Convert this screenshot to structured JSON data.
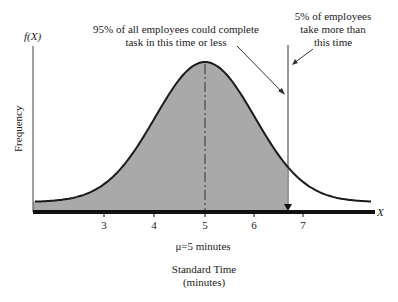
{
  "chart_data": {
    "type": "area",
    "title": "",
    "xlabel": "Standard Time (minutes)",
    "ylabel": "Frequency",
    "y_axis_symbol": "f(X)",
    "x_axis_symbol": "X",
    "x_ticks": [
      3,
      4,
      5,
      6,
      7
    ],
    "mean": 5,
    "mean_label": "μ=5 minutes",
    "cutoff": 6.65,
    "shaded_region": "below cutoff",
    "annotations": [
      {
        "text": "95% of all employees could complete task in this time or less",
        "lines": [
          "95% of all employees could complete",
          "task in this time or less"
        ],
        "points_to": "left side of cutoff line"
      },
      {
        "text": "5% of employees take more than this time",
        "lines": [
          "5% of employees",
          "take more than",
          "this time"
        ],
        "points_to": "right side of cutoff line"
      }
    ],
    "grid": false,
    "legend": "none"
  },
  "labels": {
    "fx": "f(X)",
    "x": "X",
    "frequency": "Frequency",
    "mu": "μ=5 minutes",
    "xtitle_1": "Standard Time",
    "xtitle_2": "(minutes)",
    "ann_left_1": "95% of all employees could complete",
    "ann_left_2": "task in this time or less",
    "ann_right_1": "5% of employees",
    "ann_right_2": "take more than",
    "ann_right_3": "this time",
    "ticks": [
      "3",
      "4",
      "5",
      "6",
      "7"
    ]
  },
  "colors": {
    "shade": "#a9a9a9",
    "line": "#1a1a1a"
  }
}
